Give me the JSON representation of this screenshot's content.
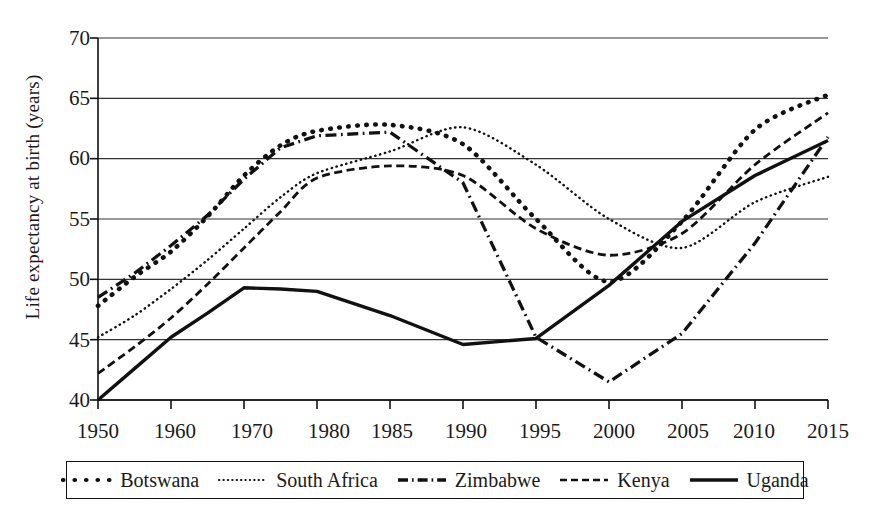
{
  "chart_data": {
    "type": "line",
    "title": "",
    "xlabel": "",
    "ylabel": "Life expectancy at birth (years)",
    "xlim": [
      1950,
      2015
    ],
    "ylim": [
      40,
      70
    ],
    "yticks": [
      40,
      45,
      50,
      55,
      60,
      65,
      70
    ],
    "xticks": [
      1950,
      1960,
      1970,
      1980,
      1985,
      1990,
      1995,
      2000,
      2005,
      2010,
      2015
    ],
    "grid": "horizontal",
    "legend_position": "below-axes",
    "x": [
      1950,
      1955,
      1960,
      1965,
      1970,
      1975,
      1980,
      1985,
      1990,
      1995,
      2000,
      2005,
      2010,
      2015
    ],
    "series": [
      {
        "name": "Botswana",
        "style": "dotted-thick",
        "values": [
          47.8,
          50.2,
          52.3,
          55.2,
          58.6,
          61.1,
          62.3,
          62.8,
          61.2,
          55.0,
          49.8,
          54.8,
          62.4,
          65.3
        ]
      },
      {
        "name": "South Africa",
        "style": "dotted-fine",
        "values": [
          45.2,
          47.0,
          49.2,
          51.6,
          54.2,
          56.8,
          58.8,
          60.6,
          62.6,
          59.5,
          55.0,
          52.6,
          56.4,
          58.5
        ]
      },
      {
        "name": "Zimbabwe",
        "style": "dash-dot",
        "values": [
          48.5,
          50.5,
          52.8,
          55.3,
          58.3,
          60.9,
          61.9,
          62.2,
          58.0,
          45.2,
          41.5,
          45.5,
          53.0,
          61.8
        ]
      },
      {
        "name": "Kenya",
        "style": "dashed",
        "values": [
          42.2,
          44.4,
          46.8,
          49.6,
          52.6,
          55.6,
          58.4,
          59.4,
          58.6,
          54.2,
          52.0,
          53.8,
          59.5,
          63.8
        ]
      },
      {
        "name": "Uganda",
        "style": "solid",
        "values": [
          40.0,
          42.6,
          45.2,
          47.2,
          49.3,
          49.2,
          49.0,
          47.0,
          44.6,
          45.1,
          49.5,
          54.8,
          58.6,
          61.5
        ]
      }
    ]
  },
  "axis": {
    "y_tick_labels": [
      "40",
      "45",
      "50",
      "55",
      "60",
      "65",
      "70"
    ],
    "x_tick_labels": [
      "1950",
      "1960",
      "1970",
      "1980",
      "1985",
      "1990",
      "1995",
      "2000",
      "2005",
      "2010",
      "2015"
    ],
    "y_axis_title": "Life expectancy at birth (years)"
  },
  "legend": {
    "items": [
      {
        "label": "Botswana",
        "style": "dotted-thick"
      },
      {
        "label": "South Africa",
        "style": "dotted-fine"
      },
      {
        "label": "Zimbabwe",
        "style": "dash-dot"
      },
      {
        "label": "Kenya",
        "style": "dashed"
      },
      {
        "label": "Uganda",
        "style": "solid"
      }
    ]
  },
  "colors": {
    "ink": "#111111",
    "grid": "#333333",
    "background": "#ffffff"
  }
}
